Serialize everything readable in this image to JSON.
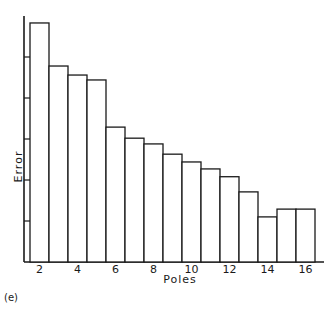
{
  "chart_data": {
    "type": "bar",
    "title": "",
    "panel_label": "(e)",
    "xlabel": "Poles",
    "ylabel": "Error",
    "categories": [
      2,
      3,
      4,
      5,
      6,
      7,
      8,
      9,
      10,
      11,
      12,
      13,
      14,
      15,
      16
    ],
    "x_tick_labels": [
      "2",
      "4",
      "6",
      "8",
      "10",
      "12",
      "14",
      "16"
    ],
    "values": [
      5.83,
      4.78,
      4.56,
      4.44,
      3.29,
      3.02,
      2.88,
      2.63,
      2.44,
      2.27,
      2.08,
      1.71,
      1.1,
      1.29,
      1.29
    ],
    "value_units": "y-axis tick intervals (no numeric y labels shown)",
    "y_ticks": [
      1,
      2,
      3,
      4,
      5
    ],
    "y_tick_labels_shown": false,
    "ylim": [
      0,
      6
    ],
    "grid": false,
    "legend": null,
    "bar_fill": "#ffffff",
    "bar_stroke": "#1a1a1a"
  }
}
